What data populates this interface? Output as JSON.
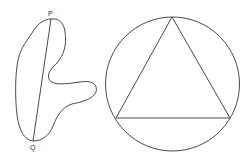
{
  "figure": {
    "left_panel": {
      "description": "Irregular closed curve with chord PQ",
      "labels": {
        "top_point": "P",
        "bottom_point": "Q"
      }
    },
    "right_panel": {
      "description": "Equilateral triangle inscribed in a circle"
    },
    "colors": {
      "stroke": "#4a4a4a",
      "background": "#ffffff"
    }
  }
}
